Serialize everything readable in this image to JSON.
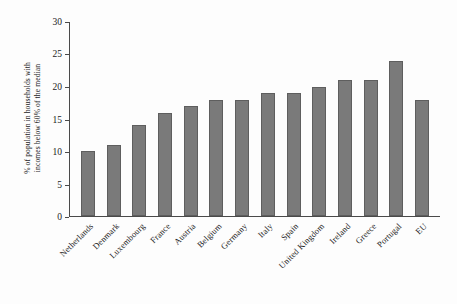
{
  "chart_data": {
    "type": "bar",
    "title": "",
    "xlabel": "",
    "ylabel": "% of population in households with incomes below 60% of the median",
    "ylabel_line1": "% of population in households with",
    "ylabel_line2": "incomes below 60% of the median",
    "ylim": [
      0,
      30
    ],
    "ytick_step": 5,
    "yticks": [
      "0",
      "5",
      "10",
      "15",
      "20",
      "25",
      "30"
    ],
    "grid": false,
    "legend": false,
    "bar_color": "#7a7a7a",
    "bar_edge_color": "#5e5e5e",
    "axis_color": "#4a4a4a",
    "background_color": "#fdfdfd",
    "categories": [
      "Netherlands",
      "Denmark",
      "Luxembourg",
      "France",
      "Austria",
      "Belgium",
      "Germany",
      "Italy",
      "Spain",
      "United Kingdom",
      "Ireland",
      "Greece",
      "Portugal",
      "EU"
    ],
    "values": [
      10,
      11,
      14,
      16,
      17,
      18,
      18,
      19,
      19,
      20,
      21,
      21,
      24,
      18
    ]
  }
}
